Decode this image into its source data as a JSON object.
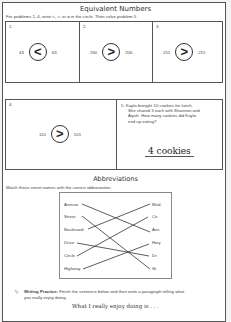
{
  "worksheet": {
    "title": "Equivalent Numbers",
    "instructions": "For problems 1–4, write <, >, or = in the circle.  Then solve problem 5.",
    "problems": [
      {
        "label": "1.",
        "left": "43",
        "symbol": "<",
        "right": "63"
      },
      {
        "label": "2.",
        "left": "260",
        "symbol": ">",
        "right": "206"
      },
      {
        "label": "3.",
        "left": "251",
        "symbol": ">",
        "right": "215"
      },
      {
        "label": "4.",
        "left": "110",
        "symbol": ">",
        "right": "101"
      }
    ],
    "problem5": {
      "label": "5.",
      "text_lines": [
        "Kayla brought 10 cookies for lunch.",
        "She shared 3 each with Shannon and",
        "Aiyah.  How many cookies did Kayla",
        "end up eating?"
      ],
      "answer": "4 cookies"
    }
  },
  "abbreviations": {
    "title": "Abbreviations",
    "instructions": "Match these street names with the correct abbreviation.",
    "names": [
      "Avenue",
      "Street",
      "Boulevard",
      "Drive",
      "Circle",
      "Highway"
    ],
    "abbrs": [
      "Blvd.",
      "Cir.",
      "Ave.",
      "Hwy.",
      "Dr.",
      "St."
    ],
    "matches": [
      {
        "name": "Avenue",
        "abbr": "Ave."
      },
      {
        "name": "Street",
        "abbr": "St."
      },
      {
        "name": "Boulevard",
        "abbr": "Blvd."
      },
      {
        "name": "Drive",
        "abbr": "Dr."
      },
      {
        "name": "Circle",
        "abbr": "Cir."
      },
      {
        "name": "Highway",
        "abbr": "Hwy."
      }
    ]
  },
  "writing": {
    "label": "Writing Practice:",
    "line1": "Finish the sentence below and then write a paragraph telling what",
    "line2": "you really enjoy doing.",
    "prompt": "What I really enjoy doing is . . .",
    "icon": "pencil-icon"
  }
}
